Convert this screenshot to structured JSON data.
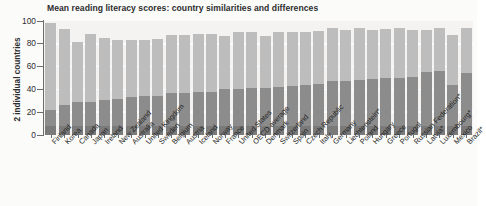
{
  "title": "Mean reading literacy scores: country similarities and differences",
  "y_axis_label": "2 individual countries",
  "axis": {
    "ticks": [
      0,
      20,
      40,
      60,
      80,
      100
    ]
  },
  "chart_data": {
    "type": "bar",
    "title": "Mean reading literacy scores: country similarities and differences",
    "subtitle": "",
    "xlabel": "",
    "ylabel": "2 individual countries",
    "ylim": [
      0,
      100
    ],
    "grid": true,
    "legend_position": "none",
    "stacked": true,
    "categories": [
      "Finland",
      "Korea",
      "Canada",
      "Japan",
      "Ireland",
      "New Zealand",
      "Australia",
      "United Kingdom",
      "Sweden",
      "Belgium",
      "Austria",
      "Iceland",
      "Norway",
      "France",
      "United States",
      "OECD average",
      "Denmark",
      "Switzerland",
      "Spain",
      "Czech Republic",
      "Italy",
      "Germany",
      "Liechtenstein",
      "Poland",
      "Hungary",
      "Greece",
      "Portugal",
      "Russian Federation",
      "Latvia",
      "Luxembourg",
      "Mexico",
      "Brazil"
    ],
    "series": [
      {
        "name": "lower band",
        "color": "#8c8c8c",
        "values": [
          22,
          26,
          29,
          29,
          31,
          32,
          33,
          34,
          34,
          37,
          37,
          38,
          38,
          40,
          40,
          41,
          41,
          42,
          43,
          44,
          45,
          47,
          47,
          48,
          49,
          50,
          50,
          51,
          55,
          56,
          44,
          54
        ]
      },
      {
        "name": "upper band",
        "color": "#bdbdbd",
        "values": [
          98,
          93,
          82,
          89,
          85,
          83,
          83,
          83,
          84,
          88,
          88,
          89,
          89,
          87,
          90,
          90,
          87,
          90,
          90,
          90,
          91,
          94,
          92,
          94,
          92,
          93,
          94,
          92,
          92,
          94,
          88,
          94
        ]
      }
    ],
    "notes": [
      "Liechtenstein*",
      "Latvia*",
      "Luxembourg*",
      "Russian Federation*",
      "Brazil*"
    ]
  },
  "countries": [
    "Finland",
    "Korea",
    "Canada",
    "Japan",
    "Ireland",
    "New Zealand",
    "Australia",
    "United Kingdom",
    "Sweden",
    "Belgium",
    "Austria",
    "Iceland",
    "Norway",
    "France",
    "United States",
    "OECD average",
    "Denmark",
    "Switzerland",
    "Spain",
    "Czech Republic",
    "Italy",
    "Germany",
    "Liechtenstein*",
    "Poland",
    "Hungary",
    "Greece",
    "Portugal",
    "Russian Federation*",
    "Latvia*",
    "Luxembourg*",
    "Mexico",
    "Brazil*"
  ]
}
